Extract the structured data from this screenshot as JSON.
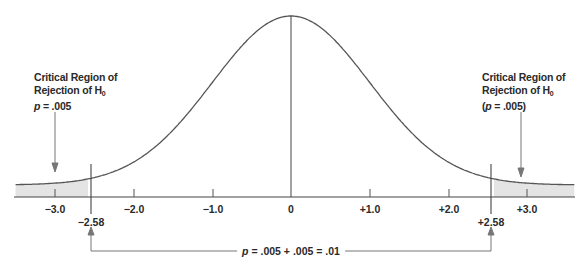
{
  "chart_data": {
    "type": "area",
    "title": "",
    "xlabel": "",
    "ylabel": "",
    "xlim": [
      -3.5,
      3.6
    ],
    "distribution": {
      "name": "normal",
      "mean": 0,
      "sd": 1
    },
    "ticks": [
      -3.0,
      -2.0,
      -1.0,
      0,
      1.0,
      2.0,
      3.0
    ],
    "tick_labels": [
      "−3.0",
      "−2.0",
      "−1.0",
      "0",
      "+1.0",
      "+2.0",
      "+3.0"
    ],
    "critical_values": [
      -2.58,
      2.58
    ],
    "critical_value_labels": [
      "−2.58",
      "+2.58"
    ],
    "shaded_regions": [
      {
        "from": -3.5,
        "to": -2.58,
        "p": 0.005
      },
      {
        "from": 2.58,
        "to": 3.6,
        "p": 0.005
      }
    ],
    "annotations": [
      {
        "position": "left-tail",
        "lines": [
          "Critical Region of",
          "Rejection of H0",
          "p = .005"
        ]
      },
      {
        "position": "right-tail",
        "lines": [
          "Critical Region of",
          "Rejection of H0",
          "(p = .005)"
        ]
      },
      {
        "position": "bottom-bracket",
        "text": "p = .005 + .005 = .01"
      }
    ],
    "grid": false,
    "legend": null
  },
  "labels": {
    "left": {
      "line1": "Critical Region of",
      "line2_prefix": "Rejection of H",
      "line2_sub": "0",
      "line3_p": "p",
      "line3_rest": " = .005"
    },
    "right": {
      "line1": "Critical Region of",
      "line2_prefix": "Rejection of H",
      "line2_sub": "0",
      "line3_open": "(",
      "line3_p": "p",
      "line3_rest": " = .005)"
    },
    "ticks": {
      "m3": "−3.0",
      "m2": "−2.0",
      "m1": "−1.0",
      "zero": "0",
      "p1": "+1.0",
      "p2": "+2.0",
      "p3": "+3.0"
    },
    "critical": {
      "left": "−2.58",
      "right": "+2.58"
    },
    "sum": {
      "p": "p",
      "rest": " = .005 + .005 = .01"
    }
  },
  "colors": {
    "curve": "#555555",
    "axis": "#444444",
    "shade": "#e4e4e4",
    "arrow": "#777777",
    "text": "#2a2a2a"
  }
}
